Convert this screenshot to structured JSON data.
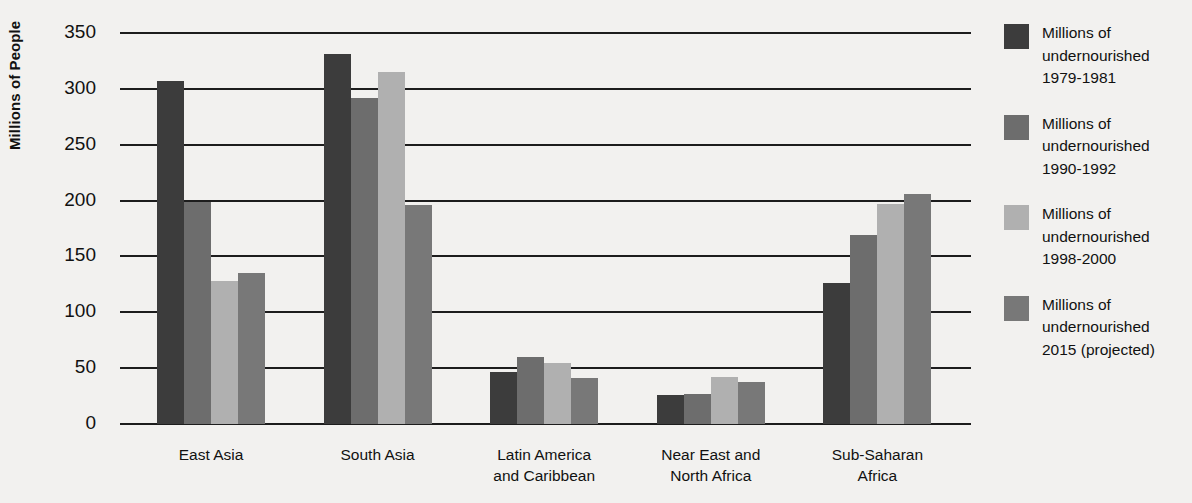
{
  "chart_data": {
    "type": "bar",
    "title": "",
    "xlabel": "",
    "ylabel": "Millions of People",
    "ylim": [
      0,
      350
    ],
    "yticks": [
      0,
      50,
      100,
      150,
      200,
      250,
      300,
      350
    ],
    "grid": true,
    "legend_position": "right",
    "categories": [
      "East Asia",
      "South Asia",
      "Latin America\nand Caribbean",
      "Near East and\nNorth Africa",
      "Sub-Saharan\nAfrica"
    ],
    "series": [
      {
        "name": "Millions of\nundernourished\n1979-1981",
        "color": "#3c3c3c",
        "values": [
          307,
          331,
          47,
          26,
          126
        ]
      },
      {
        "name": "Millions of\nundernourished\n1990-1992",
        "color": "#6d6d6d",
        "values": [
          199,
          292,
          60,
          27,
          169
        ]
      },
      {
        "name": "Millions of\nundernourished\n1998-2000",
        "color": "#b0b0b0",
        "values": [
          128,
          315,
          55,
          42,
          197
        ]
      },
      {
        "name": "Millions of\nundernourished\n2015 (projected)",
        "color": "#787878",
        "values": [
          135,
          196,
          41,
          38,
          206
        ]
      }
    ]
  },
  "colors": {
    "background": "#f2f1ef",
    "axis": "#1d1d1d",
    "text": "#111111"
  }
}
